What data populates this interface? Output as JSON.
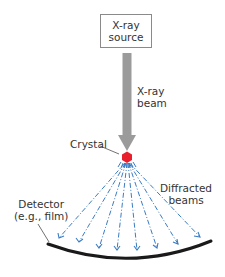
{
  "diagram": {
    "type": "x-ray-diffraction-setup",
    "source": {
      "line1": "X-ray",
      "line2": "source"
    },
    "beam_label": {
      "line1": "X-ray",
      "line2": "beam"
    },
    "crystal_label": "Crystal",
    "diffracted_label": {
      "line1": "Diffracted",
      "line2": "beams"
    },
    "detector_label": {
      "line1": "Detector",
      "line2": "(e.g., film)"
    },
    "diffracted_ray_count": 8,
    "colors": {
      "beam": "#9b9b9b",
      "crystal": "#e8202e",
      "diffracted_rays": "#3a7cc4",
      "detector": "#1a1a1a",
      "box_border": "#8a8a8a"
    }
  }
}
